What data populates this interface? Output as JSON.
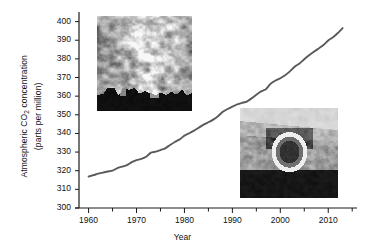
{
  "figure": {
    "background": "#ffffff",
    "line_color": "#595959",
    "axis_color": "#1a1a1a"
  },
  "axes": {
    "y_title_line1": "Atmospheric CO",
    "y_title_sub": "2",
    "y_title_line1_tail": " concentration",
    "y_title_line2": "(parts per million)",
    "x_title": "Year"
  },
  "y_ticks": [
    "300",
    "310",
    "320",
    "330",
    "340",
    "350",
    "360",
    "370",
    "380",
    "390",
    "400"
  ],
  "x_ticks": [
    "1960",
    "1970",
    "1980",
    "1990",
    "2000",
    "2010"
  ],
  "insets": [
    {
      "name": "smokestack-photo",
      "caption": "industrial smokestack emissions photograph"
    },
    {
      "name": "car-exhaust-photo",
      "caption": "car tailpipe exhaust photograph"
    }
  ],
  "chart_data": {
    "type": "line",
    "title": "",
    "xlabel": "Year",
    "ylabel": "Atmospheric CO2 concentration (parts per million)",
    "xlim": [
      1958,
      2016
    ],
    "ylim": [
      300,
      403
    ],
    "y_ticks": [
      300,
      310,
      320,
      330,
      340,
      350,
      360,
      370,
      380,
      390,
      400
    ],
    "x_ticks": [
      1960,
      1970,
      1980,
      1990,
      2000,
      2010
    ],
    "x_minor_tick_interval": 5,
    "grid": false,
    "legend": "none",
    "series": [
      {
        "name": "Atmospheric CO2 concentration",
        "color": "#595959",
        "x": [
          1960,
          1961,
          1962,
          1963,
          1964,
          1965,
          1966,
          1967,
          1968,
          1969,
          1970,
          1971,
          1972,
          1973,
          1974,
          1975,
          1976,
          1977,
          1978,
          1979,
          1980,
          1981,
          1982,
          1983,
          1984,
          1985,
          1986,
          1987,
          1988,
          1989,
          1990,
          1991,
          1992,
          1993,
          1994,
          1995,
          1996,
          1997,
          1998,
          1999,
          2000,
          2001,
          2002,
          2003,
          2004,
          2005,
          2006,
          2007,
          2008,
          2009,
          2010,
          2011,
          2012,
          2013
        ],
        "values": [
          316.9,
          317.6,
          318.4,
          319.0,
          319.6,
          320.0,
          321.4,
          322.2,
          323.0,
          324.6,
          325.7,
          326.3,
          327.5,
          329.7,
          330.2,
          331.1,
          332.0,
          333.8,
          335.4,
          336.8,
          338.8,
          340.1,
          341.5,
          343.1,
          344.7,
          346.0,
          347.4,
          349.2,
          351.6,
          353.1,
          354.4,
          355.6,
          356.4,
          357.1,
          358.8,
          360.8,
          362.6,
          363.7,
          366.7,
          368.4,
          369.6,
          371.2,
          373.3,
          375.8,
          377.5,
          379.8,
          381.9,
          383.8,
          385.6,
          387.4,
          389.9,
          391.6,
          393.9,
          396.5
        ]
      }
    ]
  }
}
